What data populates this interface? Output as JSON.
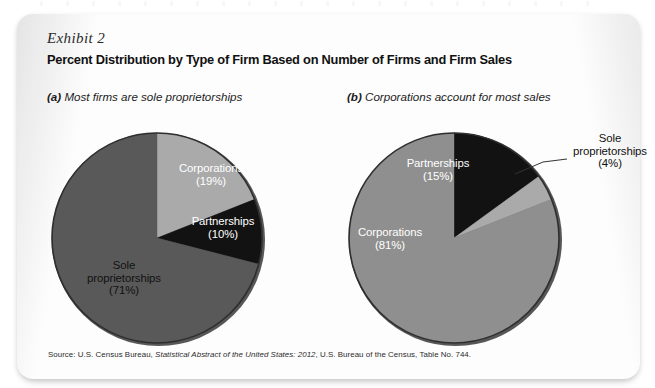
{
  "exhibit": {
    "label": "Exhibit 2",
    "title": "Percent Distribution by Type of Firm Based on Number of Firms and Firm Sales",
    "source_prefix": "Source: U.S. Census Bureau, ",
    "source_italic": "Statistical Abstract of the United States: 2012",
    "source_suffix": ", U.S. Bureau of the Census, Table No. 744."
  },
  "panels": {
    "a": {
      "tag": "(a)",
      "caption": "Most firms are sole proprietorships"
    },
    "b": {
      "tag": "(b)",
      "caption": "Corporations account for most sales"
    }
  },
  "labels": {
    "a_corporations_name": "Corporations",
    "a_corporations_pct": "(19%)",
    "a_partnerships_name": "Partnerships",
    "a_partnerships_pct": "(10%)",
    "a_sole_name_1": "Sole",
    "a_sole_name_2": "proprietorships",
    "a_sole_pct": "(71%)",
    "b_partnerships_name": "Partnerships",
    "b_partnerships_pct": "(15%)",
    "b_corporations_name": "Corporations",
    "b_corporations_pct": "(81%)",
    "b_sole_name_1": "Sole",
    "b_sole_name_2": "proprietorships",
    "b_sole_pct": "(4%)"
  },
  "colors": {
    "light_gray": "#aaaaaa",
    "mid_gray": "#8f8f8f",
    "dark_gray": "#595959",
    "black": "#121212",
    "rim": "#3a3a3a",
    "panel_bg": "#fdfdfd",
    "page_bg": "#ffffff"
  },
  "chart_data": [
    {
      "type": "pie",
      "id": "a",
      "title": "Most firms are sole proprietorships",
      "categories": [
        "Corporations",
        "Partnerships",
        "Sole proprietorships"
      ],
      "values": [
        19,
        10,
        71
      ],
      "unit": "percent",
      "start_angle_deg": 0,
      "direction": "clockwise",
      "slice_colors": [
        "#aaaaaa",
        "#121212",
        "#595959"
      ],
      "label_placement": [
        "inside",
        "inside",
        "inside"
      ],
      "legend": "none",
      "grid": false
    },
    {
      "type": "pie",
      "id": "b",
      "title": "Corporations account for most sales",
      "categories": [
        "Partnerships",
        "Sole proprietorships",
        "Corporations"
      ],
      "values": [
        15,
        4,
        81
      ],
      "unit": "percent",
      "start_angle_deg": 0,
      "direction": "clockwise",
      "slice_colors": [
        "#121212",
        "#aaaaaa",
        "#8f8f8f"
      ],
      "label_placement": [
        "inside",
        "callout",
        "inside"
      ],
      "legend": "none",
      "grid": false
    }
  ]
}
